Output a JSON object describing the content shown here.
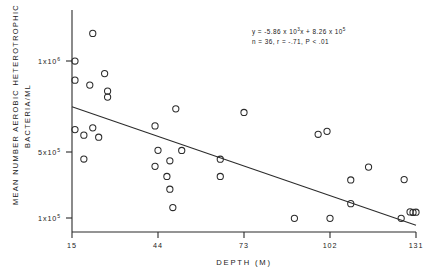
{
  "chart_data": {
    "type": "scatter",
    "title": "",
    "xlabel": "DEPTH (M)",
    "ylabel_line1": "MEAN NUMBER AEROBIC HETEROTROPHIC",
    "ylabel_line2": "BACTERIA/ML",
    "xlim": [
      15,
      131
    ],
    "ylim": [
      60000,
      1180000
    ],
    "grid": false,
    "legend": null,
    "xticks": [
      {
        "value": 15,
        "label": "15"
      },
      {
        "value": 44,
        "label": "44"
      },
      {
        "value": 73,
        "label": "73"
      },
      {
        "value": 102,
        "label": "102"
      },
      {
        "value": 131,
        "label": "131"
      }
    ],
    "yticks": [
      {
        "value": 1000000,
        "mantissa": "1x10",
        "exponent": "6"
      },
      {
        "value": 500000,
        "mantissa": "5x10",
        "exponent": "5"
      },
      {
        "value": 100000,
        "mantissa": "1x10",
        "exponent": "5"
      }
    ],
    "annotation": {
      "line1_a": "y = -5.86 x 10",
      "line1_exp": "3",
      "line1_b": "x + 8.26 x 10",
      "line1_exp2": "5",
      "line2": "n = 36, r = -.71, P < .01"
    },
    "regression": {
      "slope": -5860,
      "intercept": 826000,
      "n": 36,
      "r": -0.71,
      "p_text": "P < .01",
      "x_start": 15,
      "x_end": 131
    },
    "marker": {
      "shape": "open-circle",
      "radius_px": 3.1,
      "color": "#2b2b2b"
    },
    "points": [
      {
        "x": 22,
        "y": 1158000
      },
      {
        "x": 16,
        "y": 1000000
      },
      {
        "x": 16,
        "y": 890000
      },
      {
        "x": 26,
        "y": 928000
      },
      {
        "x": 21,
        "y": 862000
      },
      {
        "x": 27,
        "y": 828000
      },
      {
        "x": 27,
        "y": 793000
      },
      {
        "x": 50,
        "y": 726000
      },
      {
        "x": 73,
        "y": 705000
      },
      {
        "x": 16,
        "y": 607000
      },
      {
        "x": 22,
        "y": 617000
      },
      {
        "x": 43,
        "y": 628000
      },
      {
        "x": 19,
        "y": 575000
      },
      {
        "x": 24,
        "y": 563000
      },
      {
        "x": 98,
        "y": 580000
      },
      {
        "x": 101,
        "y": 597000
      },
      {
        "x": 44,
        "y": 488000
      },
      {
        "x": 52,
        "y": 487000
      },
      {
        "x": 19,
        "y": 438000
      },
      {
        "x": 48,
        "y": 428000
      },
      {
        "x": 65,
        "y": 437000
      },
      {
        "x": 43,
        "y": 396000
      },
      {
        "x": 115,
        "y": 392000
      },
      {
        "x": 47,
        "y": 338000
      },
      {
        "x": 65,
        "y": 338000
      },
      {
        "x": 109,
        "y": 318000
      },
      {
        "x": 127,
        "y": 320000
      },
      {
        "x": 48,
        "y": 265000
      },
      {
        "x": 109,
        "y": 182000
      },
      {
        "x": 49,
        "y": 160000
      },
      {
        "x": 90,
        "y": 98000
      },
      {
        "x": 102,
        "y": 98000
      },
      {
        "x": 126,
        "y": 98000
      },
      {
        "x": 129,
        "y": 135000
      },
      {
        "x": 130,
        "y": 132000
      },
      {
        "x": 131,
        "y": 133000
      }
    ]
  }
}
